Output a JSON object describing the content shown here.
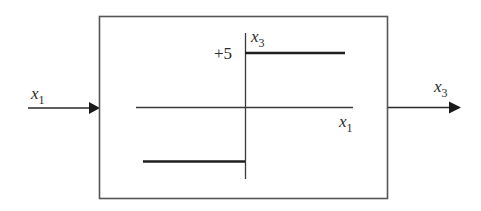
{
  "diagram": {
    "type": "block-diagram",
    "input": {
      "label": "x",
      "subscript": "1"
    },
    "output": {
      "label": "x",
      "subscript": "3"
    },
    "block": {
      "function": "step",
      "vertical_axis": {
        "label": "x",
        "subscript": "3"
      },
      "horizontal_axis": {
        "label": "x",
        "subscript": "1"
      },
      "level_label": "+5",
      "upper_level": 5,
      "lower_level": -5
    },
    "colors": {
      "stroke": "#2a2a2a",
      "box_stroke": "#555555",
      "background": "#ffffff"
    }
  }
}
